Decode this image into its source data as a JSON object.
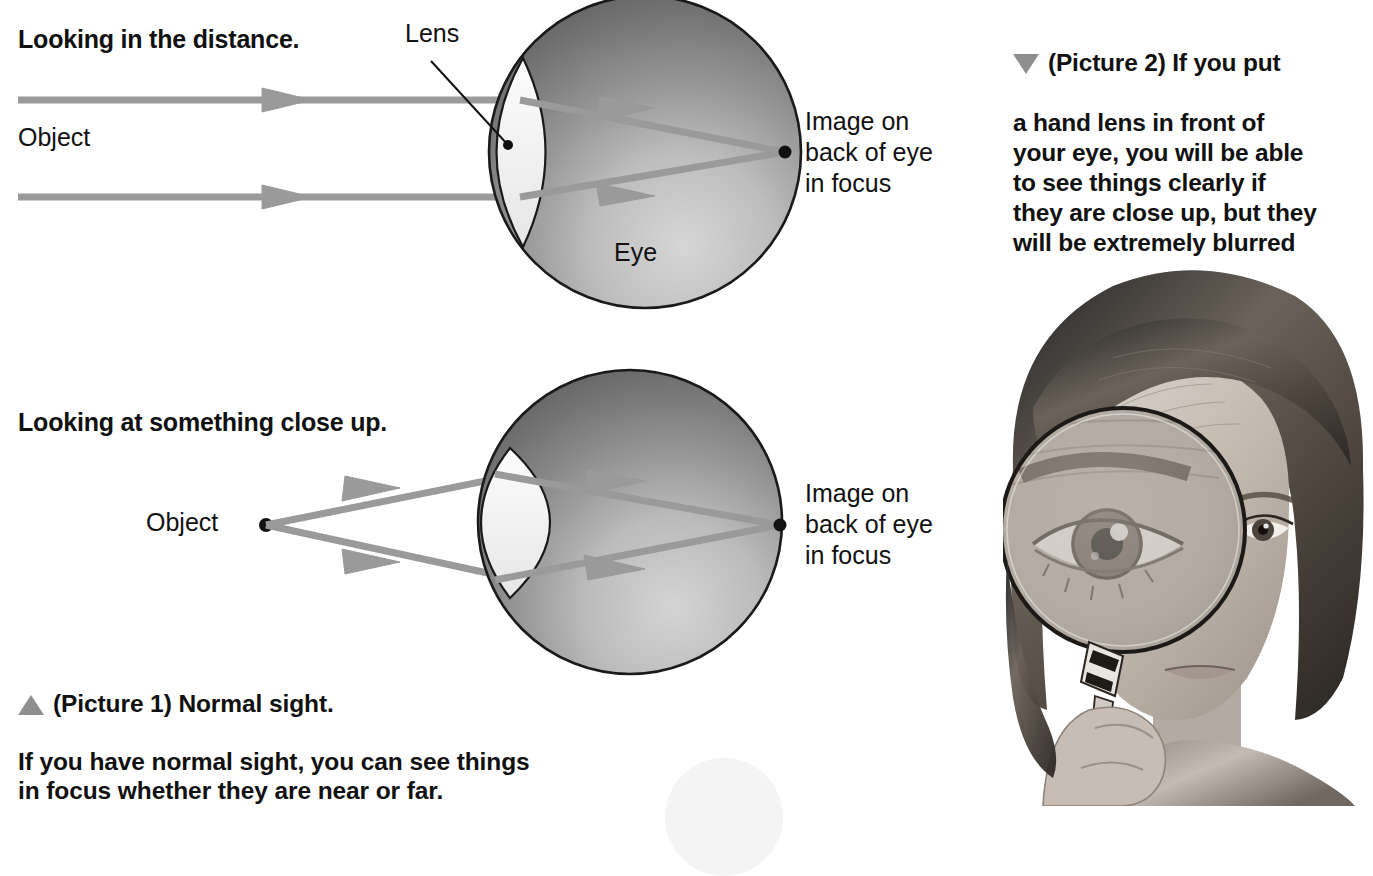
{
  "page": {
    "background": "#ffffff",
    "width": 1373,
    "height": 806
  },
  "colors": {
    "ray": "#9a9a9a",
    "eye_dark": "#5e5e5e",
    "eye_light": "#c9c9c9",
    "eye_outline": "#1a1a1a",
    "lens_fill": "#f2f2f2",
    "text": "#111111",
    "triangle": "#8f8f8f"
  },
  "diagram_top": {
    "heading": "Looking in the distance.",
    "object_label": "Object",
    "lens_label": "Lens",
    "eye_label": "Eye",
    "image_label": "Image on\nback of eye\nin focus",
    "ray_count": 2,
    "rays_parallel": true
  },
  "diagram_bottom": {
    "heading": "Looking at something close up.",
    "object_label": "Object",
    "image_label": "Image on\nback of eye\nin focus",
    "ray_count": 2,
    "rays_parallel": false
  },
  "caption_picture1": {
    "marker": "triangle-up",
    "line1": "(Picture 1) Normal sight.",
    "body": "If you have normal sight, you can see things\nin focus whether they are near or far."
  },
  "caption_picture2": {
    "marker": "triangle-down",
    "line1": "(Picture 2) If you put",
    "body": "a hand lens in front of\nyour eye, you will be able\nto see things clearly if\nthey are close up, but they\nwill be extremely blurred\nif they are far away."
  },
  "photo": {
    "description": "girl-holding-magnifying-glass",
    "alt": "Black and white photograph of a girl holding a hand lens in front of her eye"
  }
}
